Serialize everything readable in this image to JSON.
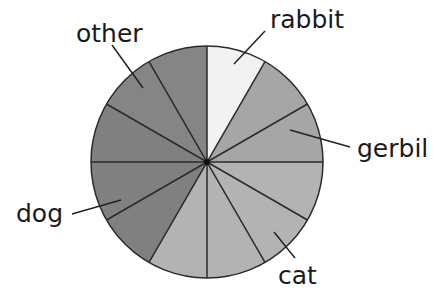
{
  "chart_data": {
    "type": "pie",
    "title": "",
    "divisions": 12,
    "categories": [
      "rabbit",
      "gerbil",
      "cat",
      "dog",
      "other"
    ],
    "values": [
      1,
      2,
      4,
      3,
      2
    ],
    "fractions": [
      "1/12",
      "2/12",
      "4/12",
      "3/12",
      "2/12"
    ],
    "start_angle_deg": 0,
    "direction": "clockwise",
    "colors": {
      "rabbit": "#f2f2f2",
      "gerbil": "#a6a6a6",
      "cat": "#b3b3b3",
      "dog": "#808080",
      "other": "#858585"
    },
    "legend": "none (callout labels with leader lines)",
    "labels": [
      {
        "text": "rabbit",
        "x": 270,
        "y": 28
      },
      {
        "text": "gerbil",
        "x": 357,
        "y": 157
      },
      {
        "text": "cat",
        "x": 278,
        "y": 284
      },
      {
        "text": "dog",
        "x": 16,
        "y": 222
      },
      {
        "text": "other",
        "x": 76,
        "y": 42
      }
    ]
  }
}
